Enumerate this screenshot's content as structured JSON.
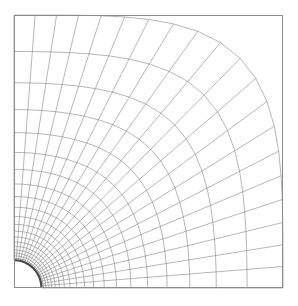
{
  "figure": {
    "type": "mesh-plot",
    "background_color": "#ffffff",
    "frame_color": "#8c8c8c",
    "grid_line_color": "#6e6e6e",
    "hole_boundary_color": "#4a4a4a"
  },
  "chart_data": {
    "type": "mesh",
    "xlabel": "",
    "ylabel": "",
    "grid": true,
    "legend": "none",
    "domain": {
      "x_min": 0,
      "x_max": 1,
      "y_min": 0,
      "y_max": 1,
      "units": "normalized"
    },
    "hole": {
      "shape": "quarter-circle",
      "center_x": 0,
      "center_y": 0,
      "radius": 0.102,
      "angle_start_deg": 0,
      "angle_end_deg": 90
    },
    "topology": {
      "scheme": "O-grid transfinite interpolation",
      "radial_divisions": 20,
      "circumferential_divisions": 20,
      "radial_stretching": "geometric",
      "radial_growth_ratio": 1.165,
      "shape_blend": "circle-to-square",
      "corner_blend_exponent": 4.0
    },
    "plot_frame": {
      "left_px": 14,
      "top_px": 15,
      "right_px": 283,
      "bottom_px": 288
    },
    "radial_layer_radii": [
      0.102,
      0.119,
      0.138,
      0.161,
      0.188,
      0.219,
      0.255,
      0.297,
      0.346,
      0.403,
      0.469,
      0.547,
      0.637,
      0.742,
      0.864,
      1.0
    ],
    "circumferential_angles_deg": [
      0,
      4.5,
      9,
      13.5,
      18,
      22.5,
      27,
      31.5,
      36,
      40.5,
      45,
      49.5,
      54,
      58.5,
      63,
      67.5,
      72,
      76.5,
      81,
      85.5,
      90
    ]
  }
}
